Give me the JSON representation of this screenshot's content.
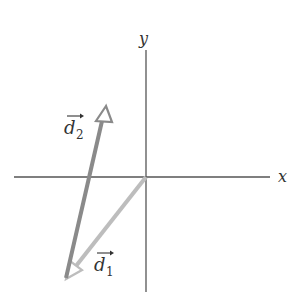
{
  "diagram": {
    "type": "vector-addition",
    "axes": {
      "x_label": "x",
      "y_label": "y",
      "origin_px": [
        146,
        177
      ],
      "color": "#555555"
    },
    "vectors": [
      {
        "id": "d1",
        "label_base": "d",
        "label_sub": "1",
        "from_px": [
          146,
          177
        ],
        "to_px": [
          66,
          278
        ],
        "color": "#bdbdbd",
        "head": "hollow-triangle"
      },
      {
        "id": "d2",
        "label_base": "d",
        "label_sub": "2",
        "from_px": [
          66,
          278
        ],
        "to_px": [
          105,
          107
        ],
        "color": "#8a8a8a",
        "head": "hollow-triangle"
      }
    ]
  }
}
